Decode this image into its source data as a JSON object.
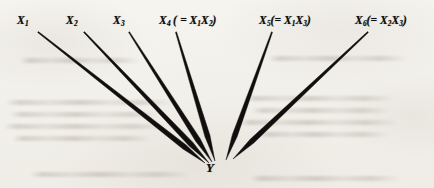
{
  "figure": {
    "background_color": "#f4f2ee",
    "ink_color": "#100f0d",
    "target": {
      "label": "Y",
      "x": 216,
      "y": 170
    },
    "predictors": [
      {
        "id": "x1",
        "base": "X",
        "subscript": "1",
        "definition": "",
        "label_x": 17,
        "label_y": 14,
        "line_start_x": 38,
        "line_start_y": 32,
        "line_end_x": 205,
        "line_end_y": 163
      },
      {
        "id": "x2",
        "base": "X",
        "subscript": "2",
        "definition": "",
        "label_x": 66,
        "label_y": 14,
        "line_start_x": 84,
        "line_start_y": 32,
        "line_end_x": 209,
        "line_end_y": 163
      },
      {
        "id": "x3",
        "base": "X",
        "subscript": "3",
        "definition": "",
        "label_x": 113,
        "label_y": 14,
        "line_start_x": 129,
        "line_start_y": 32,
        "line_end_x": 212,
        "line_end_y": 162
      },
      {
        "id": "x4",
        "base": "X",
        "subscript": "4",
        "definition": "( = X1X2 )",
        "def_open": "( =",
        "def_terms": [
          {
            "base": "X",
            "subscript": "1"
          },
          {
            "base": "X",
            "subscript": "2"
          }
        ],
        "def_close": ")",
        "label_x": 159,
        "label_y": 14,
        "line_start_x": 176,
        "line_start_y": 32,
        "line_end_x": 215,
        "line_end_y": 161
      },
      {
        "id": "x5",
        "base": "X",
        "subscript": "5",
        "definition": "(= X1X3)",
        "def_open": "(=",
        "def_terms": [
          {
            "base": "X",
            "subscript": "1"
          },
          {
            "base": "X",
            "subscript": "3"
          }
        ],
        "def_close": ")",
        "label_x": 259,
        "label_y": 14,
        "line_start_x": 272,
        "line_start_y": 32,
        "line_end_x": 226,
        "line_end_y": 160
      },
      {
        "id": "x6",
        "base": "X",
        "subscript": "6",
        "definition": "(= X2X3)",
        "def_open": "(=",
        "def_terms": [
          {
            "base": "X",
            "subscript": "2"
          },
          {
            "base": "X",
            "subscript": "3"
          }
        ],
        "def_close": ")",
        "label_x": 355,
        "label_y": 14,
        "line_start_x": 368,
        "line_start_y": 32,
        "line_end_x": 233,
        "line_end_y": 159
      }
    ],
    "bleed_marks": [
      {
        "x": 6,
        "y": 100,
        "w": 168
      },
      {
        "x": 10,
        "y": 112,
        "w": 150
      },
      {
        "x": 4,
        "y": 124,
        "w": 162
      },
      {
        "x": 12,
        "y": 136,
        "w": 140
      },
      {
        "x": 244,
        "y": 96,
        "w": 150
      },
      {
        "x": 252,
        "y": 108,
        "w": 138
      },
      {
        "x": 238,
        "y": 120,
        "w": 160
      },
      {
        "x": 258,
        "y": 132,
        "w": 130
      },
      {
        "x": 20,
        "y": 58,
        "w": 120
      },
      {
        "x": 268,
        "y": 56,
        "w": 140
      },
      {
        "x": 30,
        "y": 172,
        "w": 160
      },
      {
        "x": 250,
        "y": 176,
        "w": 150
      }
    ]
  }
}
